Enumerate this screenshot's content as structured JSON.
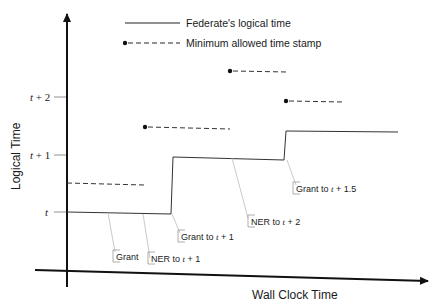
{
  "diagram": {
    "legend": {
      "solid_label": "Federate's logical time",
      "dashed_label": "Minimum allowed time stamp"
    },
    "axes": {
      "y_title": "Logical Time",
      "x_title": "Wall Clock Time",
      "y_ticks": [
        {
          "var": "t",
          "suffix": "",
          "y": 212
        },
        {
          "var": "t",
          "suffix": " + 1",
          "y": 155
        },
        {
          "var": "t",
          "suffix": " + 2",
          "y": 97
        }
      ]
    },
    "events": [
      {
        "label": "Grant",
        "var": "",
        "suffix": ""
      },
      {
        "label": "NER to ",
        "var": "t",
        "suffix": " + 1"
      },
      {
        "label": "Grant to ",
        "var": "t",
        "suffix": " + 1"
      },
      {
        "label": "NER to ",
        "var": "t",
        "suffix": " + 2"
      },
      {
        "label": "Grant to ",
        "var": "t",
        "suffix": " + 1.5"
      }
    ],
    "colors": {
      "line": "#222222",
      "leader": "#bbbbbb",
      "box": "#999999"
    }
  }
}
